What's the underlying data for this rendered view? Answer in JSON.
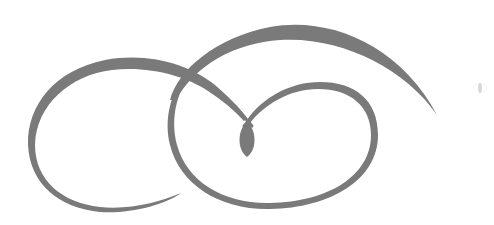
{
  "image": {
    "description": "Decorative calligraphic flourish ornament with two interlocking loops, a sweeping upper arc, and a teardrop terminal",
    "ink_color": "#7a7a7a",
    "background_color": "#ffffff"
  },
  "ornament": {
    "parts": [
      {
        "name": "left-loop",
        "label": "Left loop"
      },
      {
        "name": "upper-arc",
        "label": "Upper sweeping arc"
      },
      {
        "name": "right-loop",
        "label": "Right loop"
      },
      {
        "name": "teardrop-terminal",
        "label": "Teardrop terminal"
      }
    ]
  }
}
